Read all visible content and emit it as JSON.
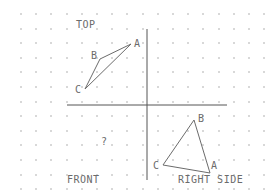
{
  "diagram": {
    "type": "orthographic-projection",
    "colors": {
      "background": "#ffffff",
      "grid_dot": "#d8d8d8",
      "line": "#6b6b6b",
      "axis": "#555555",
      "text": "#6b6b6b"
    },
    "grid": {
      "x_start": 21,
      "x_step": 15.2,
      "y_start": 14,
      "y_step": 14.6
    },
    "axes": {
      "horizontal": {
        "x1": 67,
        "y1": 105,
        "x2": 227,
        "y2": 105
      },
      "vertical": {
        "x1": 147,
        "y1": 29,
        "x2": 147,
        "y2": 180
      }
    },
    "views": {
      "top": {
        "label": "TOP",
        "label_pos": {
          "x": 76,
          "y": 20
        },
        "triangle": {
          "A": {
            "x": 131,
            "y": 44
          },
          "B": {
            "x": 100,
            "y": 59
          },
          "C": {
            "x": 85,
            "y": 89
          }
        },
        "vertex_labels": [
          {
            "text": "A",
            "x": 134,
            "y": 39
          },
          {
            "text": "B",
            "x": 91,
            "y": 51
          },
          {
            "text": "C",
            "x": 75,
            "y": 85
          }
        ]
      },
      "front": {
        "label": "FRONT",
        "label_pos": {
          "x": 67,
          "y": 175
        },
        "unknown": "?",
        "unknown_pos": {
          "x": 101,
          "y": 137
        }
      },
      "right_side": {
        "label": "RIGHT SIDE",
        "label_pos": {
          "x": 178,
          "y": 175
        },
        "triangle": {
          "A": {
            "x": 210,
            "y": 173
          },
          "B": {
            "x": 194,
            "y": 120
          },
          "C": {
            "x": 163,
            "y": 165
          }
        },
        "vertex_labels": [
          {
            "text": "A",
            "x": 211,
            "y": 161
          },
          {
            "text": "B",
            "x": 198,
            "y": 114
          },
          {
            "text": "C",
            "x": 153,
            "y": 161
          }
        ]
      }
    }
  }
}
